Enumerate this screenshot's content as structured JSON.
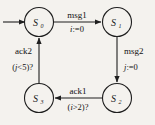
{
  "diagram": {
    "type": "state-machine",
    "background_color": "#f4f2ee",
    "stroke_color": "#1f1f1f",
    "text_color": "#111111",
    "states": [
      {
        "id": "s0",
        "name": "S",
        "subscript": "0",
        "initial": true,
        "x": 39,
        "y": 22
      },
      {
        "id": "s1",
        "name": "S",
        "subscript": "1",
        "initial": false,
        "x": 117,
        "y": 22
      },
      {
        "id": "s2",
        "name": "S",
        "subscript": "2",
        "initial": false,
        "x": 117,
        "y": 98
      },
      {
        "id": "s3",
        "name": "S",
        "subscript": "3",
        "initial": false,
        "x": 39,
        "y": 98
      }
    ],
    "transitions": [
      {
        "id": "t0",
        "from": "s0",
        "to": "s1",
        "event": "msg1",
        "action": "i:=0",
        "action_var": "i",
        "action_rest": ":=0",
        "direction": "right"
      },
      {
        "id": "t1",
        "from": "s1",
        "to": "s2",
        "event": "msg2",
        "action": "j:=0",
        "action_var": "j",
        "action_rest": ":=0",
        "direction": "down"
      },
      {
        "id": "t2",
        "from": "s2",
        "to": "s3",
        "event": "ack1",
        "action": "(i>2)?",
        "action_prefix": "(",
        "action_var": "i",
        "action_rest": ">2)?",
        "direction": "left"
      },
      {
        "id": "t3",
        "from": "s3",
        "to": "s0",
        "event": "ack2",
        "action": "(j<5)?",
        "action_prefix": "(",
        "action_var": "j",
        "action_rest": "<5)?",
        "direction": "up"
      }
    ],
    "initial_marker": {
      "label": "",
      "x": 6,
      "y": 22
    }
  }
}
